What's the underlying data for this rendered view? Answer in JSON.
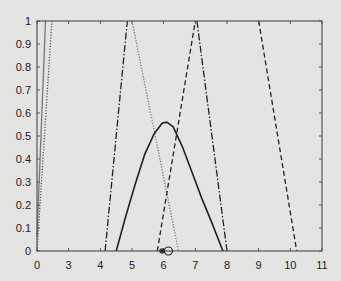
{
  "chart_data": {
    "type": "line",
    "title": "",
    "xlabel": "",
    "ylabel": "",
    "xlim": [
      2,
      11
    ],
    "ylim": [
      0,
      1
    ],
    "grid": false,
    "legend": "none",
    "x_ticks": [
      {
        "value": 2,
        "label": "0"
      },
      {
        "value": 3,
        "label": "3"
      },
      {
        "value": 4,
        "label": "4"
      },
      {
        "value": 5,
        "label": "5"
      },
      {
        "value": 6,
        "label": "6"
      },
      {
        "value": 7,
        "label": "7"
      },
      {
        "value": 8,
        "label": "8"
      },
      {
        "value": 9,
        "label": "9"
      },
      {
        "value": 10,
        "label": "10"
      },
      {
        "value": 11,
        "label": "11"
      }
    ],
    "y_ticks": [
      {
        "value": 0,
        "label": "0"
      },
      {
        "value": 0.1,
        "label": "0.1"
      },
      {
        "value": 0.2,
        "label": "0.2"
      },
      {
        "value": 0.3,
        "label": "0.3"
      },
      {
        "value": 0.4,
        "label": "0.4"
      },
      {
        "value": 0.5,
        "label": "0.5"
      },
      {
        "value": 0.6,
        "label": "0.6"
      },
      {
        "value": 0.7,
        "label": "0.7"
      },
      {
        "value": 0.8,
        "label": "0.8"
      },
      {
        "value": 0.9,
        "label": "0.9"
      },
      {
        "value": 1,
        "label": "1"
      }
    ],
    "series": [
      {
        "name": "left-gray-solid",
        "style": "solid",
        "color": "#777777",
        "points": [
          [
            2.0,
            0.06
          ],
          [
            2.27,
            1.0
          ]
        ]
      },
      {
        "name": "left-dotted",
        "style": "dotted",
        "color": "#555555",
        "points": [
          [
            2.0,
            0.0
          ],
          [
            2.47,
            1.0
          ]
        ]
      },
      {
        "name": "dash-dot-triangle",
        "style": "dashdot",
        "color": "#222222",
        "points": [
          [
            4.15,
            0.0
          ],
          [
            4.85,
            1.0
          ],
          [
            11.0,
            1.0
          ],
          [
            8.0,
            0.0
          ]
        ],
        "segments": [
          [
            [
              4.15,
              0.0
            ],
            [
              4.85,
              1.0
            ]
          ],
          [
            [
              7.05,
              1.0
            ],
            [
              8.0,
              0.0
            ]
          ]
        ]
      },
      {
        "name": "gray-dotted-descending",
        "style": "dotted",
        "color": "#777777",
        "points": [
          [
            5.0,
            1.0
          ],
          [
            6.47,
            0.0
          ]
        ]
      },
      {
        "name": "dashed-triangle",
        "style": "dashed",
        "color": "#222222",
        "points": [
          [
            5.8,
            0.0
          ],
          [
            7.0,
            1.0
          ]
        ]
      },
      {
        "name": "dashed-right",
        "style": "dashed",
        "color": "#222222",
        "points": [
          [
            9.0,
            1.0
          ],
          [
            10.2,
            0.0
          ]
        ]
      },
      {
        "name": "solid-curve",
        "style": "solid",
        "color": "#222222",
        "points": [
          [
            4.5,
            0.0
          ],
          [
            4.8,
            0.15
          ],
          [
            5.1,
            0.29
          ],
          [
            5.4,
            0.42
          ],
          [
            5.7,
            0.51
          ],
          [
            5.95,
            0.555
          ],
          [
            6.1,
            0.56
          ],
          [
            6.3,
            0.54
          ],
          [
            6.6,
            0.45
          ],
          [
            6.9,
            0.34
          ],
          [
            7.2,
            0.23
          ],
          [
            7.5,
            0.13
          ],
          [
            7.87,
            0.0
          ]
        ]
      }
    ],
    "markers": [
      {
        "name": "star-marker",
        "symbol": "*",
        "x": 5.95,
        "y": 0.0
      },
      {
        "name": "circle-marker",
        "symbol": "o",
        "x": 6.15,
        "y": 0.0
      }
    ]
  }
}
